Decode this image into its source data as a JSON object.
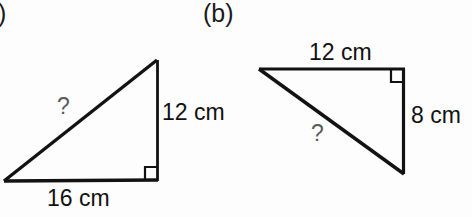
{
  "page": {
    "background_color": "#fdfdfd",
    "ink_color": "#121212",
    "unknown_color": "#5a5a5a"
  },
  "figures": [
    {
      "id": "a",
      "label": "a)",
      "shape": "right-triangle",
      "right_angle_vertex": "bottom-right",
      "labels": {
        "base": "16 cm",
        "vertical": "12 cm",
        "hypotenuse": "?"
      }
    },
    {
      "id": "b",
      "label": "(b)",
      "shape": "right-triangle",
      "right_angle_vertex": "top-right",
      "labels": {
        "top": "12 cm",
        "vertical": "8 cm",
        "hypotenuse": "?"
      }
    }
  ]
}
